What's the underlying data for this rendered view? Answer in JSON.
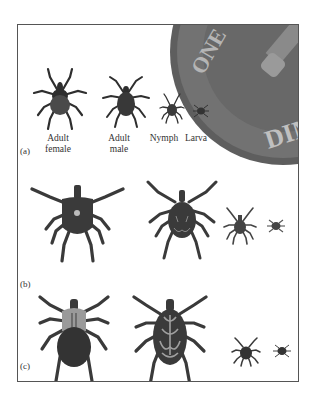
{
  "figure": {
    "panels": [
      {
        "id": "a",
        "label": "(a)",
        "stages": [
          {
            "name": "Adult female",
            "line1": "Adult",
            "line2": "female"
          },
          {
            "name": "Adult male",
            "line1": "Adult",
            "line2": "male"
          },
          {
            "name": "Nymph",
            "line1": "Nymph",
            "line2": ""
          },
          {
            "name": "Larva",
            "line1": "Larva",
            "line2": ""
          }
        ],
        "scale_reference": {
          "object": "dime",
          "text": "DIME"
        }
      },
      {
        "id": "b",
        "label": "(b)"
      },
      {
        "id": "c",
        "label": "(c)"
      }
    ],
    "colors": {
      "frame": "#555555",
      "tick_dark": "#2e2e2e",
      "tick_body": "#474747",
      "tick_light": "#9a9a9a",
      "coin": "#6a6a6a"
    }
  }
}
